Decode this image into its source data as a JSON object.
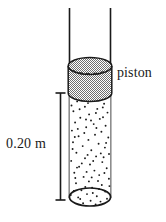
{
  "figure": {
    "labels": {
      "piston": "piston",
      "length": "0.20 m"
    },
    "colors": {
      "outline": "#1a1a1a",
      "piston_fill": "#9a9a9a",
      "gas_fill": "#ffffff",
      "particle": "#1a1a1a",
      "background": "#ffffff"
    }
  },
  "diagram_data": {
    "type": "physics-schematic",
    "description": "Vertical open-topped cylindrical tube containing a gas, sealed by a movable piston near the top. A dimension line at the left marks the gas column height.",
    "tube": {
      "left_wall_x": 69,
      "right_wall_x": 111,
      "top_y": 8,
      "bottom_y": 205,
      "open_top": true,
      "closed_bottom": true,
      "bottom_ellipse_ry": 9
    },
    "piston": {
      "top_ellipse_cy": 66,
      "bottom_ellipse_cy": 93,
      "rx": 22,
      "ry": 8,
      "fill_pattern": "checkerboard-dither",
      "dashed_back_edge": true
    },
    "gas": {
      "top_y": 93,
      "bottom_y": 205,
      "particle_count": 86,
      "representation": "random-dots"
    },
    "dimension_line": {
      "x": 60,
      "top_y": 93,
      "bottom_y": 200,
      "cap_half_width": 5,
      "measured_quantity": "gas column height",
      "value": "0.20 m"
    }
  }
}
